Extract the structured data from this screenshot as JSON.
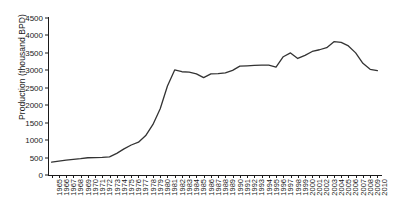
{
  "chart_data": {
    "type": "line",
    "title": "",
    "xlabel": "",
    "ylabel": "Production (thousand BPD)",
    "ylim": [
      0,
      4500
    ],
    "yticks": [
      0,
      500,
      1000,
      1500,
      2000,
      2500,
      3000,
      3500,
      4000,
      4500
    ],
    "grid": false,
    "legend": "none",
    "line_color": "#333333",
    "categories": [
      "1965",
      "1966",
      "1967",
      "1968",
      "1969",
      "1970",
      "1971",
      "1972",
      "1973",
      "1974",
      "1975",
      "1976",
      "1977",
      "1978",
      "1979",
      "1980",
      "1981",
      "1982",
      "1983",
      "1984",
      "1985",
      "1986",
      "1987",
      "1988",
      "1989",
      "1990",
      "1991",
      "1992",
      "1993",
      "1994",
      "1995",
      "1996",
      "1997",
      "1998",
      "1999",
      "2000",
      "2001",
      "2002",
      "2003",
      "2004",
      "2005",
      "2006",
      "2007",
      "2008",
      "2009",
      "2010"
    ],
    "values": [
      370,
      400,
      425,
      450,
      470,
      495,
      500,
      505,
      520,
      620,
      750,
      860,
      940,
      1130,
      1450,
      1900,
      2550,
      3010,
      2960,
      2950,
      2900,
      2790,
      2900,
      2905,
      2930,
      3000,
      3120,
      3130,
      3140,
      3150,
      3150,
      3090,
      3390,
      3500,
      3340,
      3430,
      3540,
      3590,
      3650,
      3820,
      3800,
      3700,
      3500,
      3200,
      3030,
      2990
    ]
  }
}
